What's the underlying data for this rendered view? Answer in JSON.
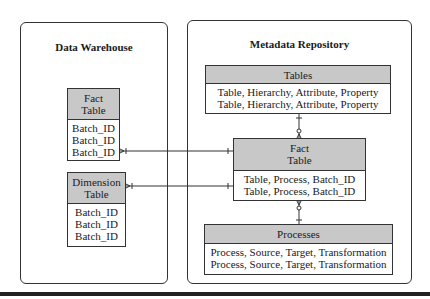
{
  "diagram": {
    "type": "entity-relationship",
    "panels": {
      "data_warehouse": {
        "title": "Data Warehouse",
        "entities": {
          "fact_table": {
            "header_line1": "Fact",
            "header_line2": "Table",
            "rows": [
              "Batch_ID",
              "Batch_ID",
              "Batch_ID"
            ]
          },
          "dimension_table": {
            "header_line1": "Dimension",
            "header_line2": "Table",
            "rows": [
              "Batch_ID",
              "Batch_ID",
              "Batch_ID"
            ]
          }
        }
      },
      "metadata_repository": {
        "title": "Metadata Repository",
        "entities": {
          "tables": {
            "header": "Tables",
            "rows": [
              "Table, Hierarchy, Attribute, Property",
              "Table, Hierarchy, Attribute, Property"
            ]
          },
          "fact_table": {
            "header_line1": "Fact",
            "header_line2": "Table",
            "rows": [
              "Table, Process, Batch_ID",
              "Table, Process, Batch_ID"
            ]
          },
          "processes": {
            "header": "Processes",
            "rows": [
              "Process, Source, Target, Transformation",
              "Process, Source, Target, Transformation"
            ]
          }
        }
      }
    },
    "relationships": [
      {
        "from": "data_warehouse.fact_table",
        "to": "metadata_repository.fact_table",
        "from_end": "many",
        "to_end": "one"
      },
      {
        "from": "data_warehouse.dimension_table",
        "to": "metadata_repository.fact_table",
        "from_end": "many",
        "to_end": "one"
      },
      {
        "from": "metadata_repository.tables",
        "to": "metadata_repository.fact_table",
        "from_end": "one",
        "to_end": "zero-or-many"
      },
      {
        "from": "metadata_repository.processes",
        "to": "metadata_repository.fact_table",
        "from_end": "one",
        "to_end": "zero-or-many"
      }
    ],
    "colors": {
      "header_fill": "#c8c8c8",
      "border": "#333333",
      "background": "#ffffff"
    }
  }
}
